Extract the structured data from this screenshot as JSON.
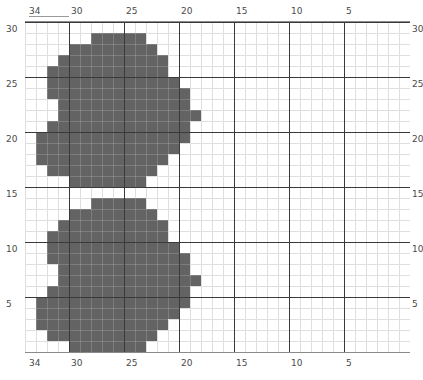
{
  "figure": {
    "kind": "pixel-grid-plot",
    "background": "#ffffff",
    "cell_color": "#636363",
    "minor_grid_color": "#d8d8d8",
    "major_grid_color": "#3a3a3a",
    "tick_label_color": "#4a4a4a"
  },
  "axes": {
    "top": {
      "labels": [
        "34",
        "30",
        "25",
        "20",
        "15",
        "10",
        "5"
      ]
    },
    "bottom": {
      "labels": [
        "34",
        "30",
        "25",
        "20",
        "15",
        "10",
        "5"
      ]
    },
    "left": {
      "labels": [
        "30",
        "25",
        "20",
        "15",
        "10",
        "5"
      ]
    },
    "right": {
      "labels": [
        "30",
        "25",
        "20",
        "15",
        "10",
        "5"
      ]
    }
  },
  "chart_data": {
    "type": "heatmap",
    "title": "",
    "xlabel": "",
    "ylabel": "",
    "x_direction": "decreasing",
    "y_direction": "decreasing",
    "x_ticks": [
      34,
      30,
      25,
      20,
      15,
      10,
      5
    ],
    "y_ticks": [
      30,
      25,
      20,
      15,
      10,
      5
    ],
    "xlim": [
      34,
      1
    ],
    "ylim": [
      30,
      1
    ],
    "grid": true,
    "legend": null,
    "n_cols": 35,
    "n_rows": 30,
    "cell_px": 11,
    "filled_color": "#636363",
    "empty_color": "#ffffff",
    "note": "Two near-identical filled blob regions, upper and lower, drawn as filled grid cells.",
    "rows": [
      {
        "row": 0,
        "spans": []
      },
      {
        "row": 1,
        "spans": [
          [
            6,
            10
          ]
        ]
      },
      {
        "row": 2,
        "spans": [
          [
            4,
            11
          ]
        ]
      },
      {
        "row": 3,
        "spans": [
          [
            3,
            12
          ]
        ]
      },
      {
        "row": 4,
        "spans": [
          [
            2,
            12
          ]
        ]
      },
      {
        "row": 5,
        "spans": [
          [
            2,
            13
          ]
        ]
      },
      {
        "row": 6,
        "spans": [
          [
            2,
            14
          ]
        ]
      },
      {
        "row": 7,
        "spans": [
          [
            3,
            14
          ]
        ]
      },
      {
        "row": 8,
        "spans": [
          [
            3,
            15
          ]
        ]
      },
      {
        "row": 9,
        "spans": [
          [
            2,
            14
          ]
        ]
      },
      {
        "row": 10,
        "spans": [
          [
            1,
            14
          ]
        ]
      },
      {
        "row": 11,
        "spans": [
          [
            1,
            13
          ]
        ]
      },
      {
        "row": 12,
        "spans": [
          [
            1,
            12
          ]
        ]
      },
      {
        "row": 13,
        "spans": [
          [
            2,
            11
          ]
        ]
      },
      {
        "row": 14,
        "spans": [
          [
            4,
            10
          ]
        ]
      },
      {
        "row": 15,
        "spans": []
      },
      {
        "row": 16,
        "spans": [
          [
            6,
            10
          ]
        ]
      },
      {
        "row": 17,
        "spans": [
          [
            4,
            11
          ]
        ]
      },
      {
        "row": 18,
        "spans": [
          [
            3,
            12
          ]
        ]
      },
      {
        "row": 19,
        "spans": [
          [
            2,
            12
          ]
        ]
      },
      {
        "row": 20,
        "spans": [
          [
            2,
            13
          ]
        ]
      },
      {
        "row": 21,
        "spans": [
          [
            2,
            14
          ]
        ]
      },
      {
        "row": 22,
        "spans": [
          [
            3,
            14
          ]
        ]
      },
      {
        "row": 23,
        "spans": [
          [
            3,
            15
          ]
        ]
      },
      {
        "row": 24,
        "spans": [
          [
            2,
            14
          ]
        ]
      },
      {
        "row": 25,
        "spans": [
          [
            1,
            14
          ]
        ]
      },
      {
        "row": 26,
        "spans": [
          [
            1,
            13
          ]
        ]
      },
      {
        "row": 27,
        "spans": [
          [
            1,
            12
          ]
        ]
      },
      {
        "row": 28,
        "spans": [
          [
            2,
            11
          ]
        ]
      },
      {
        "row": 29,
        "spans": [
          [
            4,
            10
          ]
        ]
      }
    ],
    "major_gridlines": {
      "vertical_cols": [
        4,
        9,
        14,
        19,
        24,
        29
      ],
      "horizontal_rows": [
        0,
        5,
        10,
        15,
        20,
        25
      ]
    }
  }
}
